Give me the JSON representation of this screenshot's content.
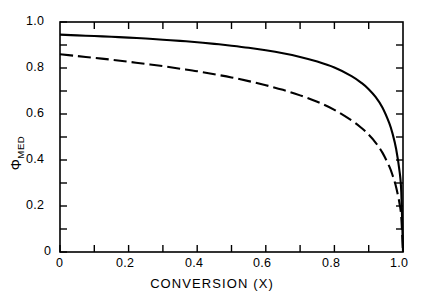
{
  "chart_data": {
    "type": "line",
    "title": "",
    "subtitle": "",
    "xlabel": "CONVERSION (X)",
    "ylabel": "Φ",
    "ylabel_subscript": "MED",
    "xlim": [
      0,
      1.0
    ],
    "ylim": [
      0,
      1.0
    ],
    "grid": false,
    "legend": "none",
    "xticks": [
      0,
      0.1,
      0.2,
      0.3,
      0.4,
      0.5,
      0.6,
      0.7,
      0.8,
      0.9,
      1.0
    ],
    "xtick_labels": [
      "0",
      "",
      "0.2",
      "",
      "0.4",
      "",
      "0.6",
      "",
      "0.8",
      "",
      "1.0"
    ],
    "yticks": [
      0,
      0.1,
      0.2,
      0.3,
      0.4,
      0.5,
      0.6,
      0.7,
      0.8,
      0.9,
      1.0
    ],
    "ytick_labels": [
      "0",
      "",
      "0.2",
      "",
      "0.4",
      "",
      "0.6",
      "",
      "0.8",
      "",
      "1.0"
    ],
    "ticks_inward": true,
    "ticks_all_sides": true,
    "frame_color": "#000000",
    "series": [
      {
        "name": "upper-curve",
        "style": "solid",
        "color": "#000000",
        "x": [
          0.0,
          0.05,
          0.1,
          0.15,
          0.2,
          0.25,
          0.3,
          0.35,
          0.4,
          0.45,
          0.5,
          0.55,
          0.6,
          0.65,
          0.7,
          0.75,
          0.8,
          0.85,
          0.88,
          0.9,
          0.92,
          0.94,
          0.96,
          0.97,
          0.98,
          0.99,
          0.995,
          1.0
        ],
        "y": [
          0.945,
          0.942,
          0.939,
          0.936,
          0.932,
          0.928,
          0.923,
          0.918,
          0.912,
          0.905,
          0.897,
          0.888,
          0.877,
          0.864,
          0.848,
          0.828,
          0.802,
          0.765,
          0.734,
          0.708,
          0.674,
          0.628,
          0.56,
          0.512,
          0.448,
          0.35,
          0.26,
          0.0
        ]
      },
      {
        "name": "lower-curve",
        "style": "dashed",
        "color": "#000000",
        "x": [
          0.0,
          0.05,
          0.1,
          0.15,
          0.2,
          0.25,
          0.3,
          0.35,
          0.4,
          0.45,
          0.5,
          0.55,
          0.6,
          0.65,
          0.7,
          0.75,
          0.8,
          0.85,
          0.88,
          0.9,
          0.92,
          0.94,
          0.96,
          0.97,
          0.98,
          0.99,
          0.995,
          1.0
        ],
        "y": [
          0.86,
          0.852,
          0.844,
          0.836,
          0.827,
          0.818,
          0.808,
          0.797,
          0.786,
          0.773,
          0.759,
          0.743,
          0.725,
          0.705,
          0.681,
          0.653,
          0.618,
          0.572,
          0.538,
          0.51,
          0.476,
          0.432,
          0.372,
          0.332,
          0.282,
          0.21,
          0.15,
          0.0
        ]
      }
    ]
  },
  "axis": {
    "x_tick_text": [
      "0",
      "0.2",
      "0.4",
      "0.6",
      "0.8",
      "1.0"
    ],
    "y_tick_text": [
      "1.0",
      "0.8",
      "0.6",
      "0.4",
      "0.2",
      "0"
    ]
  },
  "labels": {
    "x_axis_title": "CONVERSION (X)",
    "y_axis_symbol": "Φ",
    "y_axis_sub": "MED"
  }
}
